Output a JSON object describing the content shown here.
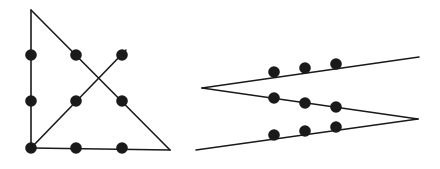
{
  "canvas": {
    "width": 440,
    "height": 169,
    "background": "#ffffff",
    "title": "Two geometric dot-and-line figures"
  },
  "style": {
    "line_color": "#1a1a1a",
    "line_width": 1.6,
    "dot_color": "#1a1a1a",
    "dot_radius": 5.8
  },
  "figures": [
    {
      "id": "left-figure",
      "name": "triangle-with-crossing-diagonals",
      "label": "Triangle with crossed diagonals and nine dots",
      "vertices": {
        "apex": {
          "x": 31,
          "y": 10
        },
        "bottom_left": {
          "x": 31,
          "y": 148
        },
        "bottom_right": {
          "x": 170,
          "y": 150
        }
      },
      "segments": [
        {
          "name": "left-vertical-edge",
          "x1": 31,
          "y1": 10,
          "x2": 31,
          "y2": 148
        },
        {
          "name": "hypotenuse-apex-to-bottom-right",
          "x1": 31,
          "y1": 10,
          "x2": 170,
          "y2": 150
        },
        {
          "name": "bottom-edge",
          "x1": 31,
          "y1": 148,
          "x2": 170,
          "y2": 150
        },
        {
          "name": "rising-diagonal-bottom-left-to-upper-right",
          "x1": 31,
          "y1": 148,
          "x2": 126,
          "y2": 50
        }
      ],
      "dots": [
        {
          "name": "dot-left-upper",
          "x": 31,
          "y": 55
        },
        {
          "name": "dot-left-middle",
          "x": 31,
          "y": 101
        },
        {
          "name": "dot-left-bottom-corner",
          "x": 31,
          "y": 148
        },
        {
          "name": "dot-top-middle",
          "x": 76,
          "y": 55
        },
        {
          "name": "dot-top-right",
          "x": 122,
          "y": 55
        },
        {
          "name": "dot-center-left",
          "x": 76,
          "y": 101
        },
        {
          "name": "dot-center-right",
          "x": 122,
          "y": 101
        },
        {
          "name": "dot-bottom-middle-left",
          "x": 76,
          "y": 148
        },
        {
          "name": "dot-bottom-middle-right",
          "x": 122,
          "y": 148
        }
      ]
    },
    {
      "id": "right-figure",
      "name": "zigzag-chevron-with-dot-grid",
      "label": "Open zigzag chevron with nine dots in three rows",
      "vertices": {
        "left_vertex": {
          "x": 202,
          "y": 88
        },
        "right_vertex": {
          "x": 418,
          "y": 119
        },
        "top_right_end": {
          "x": 419,
          "y": 57
        },
        "bottom_left_end": {
          "x": 196,
          "y": 150
        }
      },
      "segments": [
        {
          "name": "upper-arm-top-right-to-left-vertex",
          "x1": 419,
          "y1": 57,
          "x2": 202,
          "y2": 88
        },
        {
          "name": "middle-arm-left-vertex-to-right-vertex",
          "x1": 202,
          "y1": 88,
          "x2": 418,
          "y2": 119
        },
        {
          "name": "lower-arm-right-vertex-to-bottom-left-end",
          "x1": 418,
          "y1": 119,
          "x2": 196,
          "y2": 150
        }
      ],
      "dots": [
        {
          "name": "dot-upper-row-left",
          "x": 274,
          "y": 72
        },
        {
          "name": "dot-upper-row-middle",
          "x": 305,
          "y": 68
        },
        {
          "name": "dot-upper-row-right",
          "x": 336,
          "y": 64
        },
        {
          "name": "dot-middle-row-left",
          "x": 274,
          "y": 98
        },
        {
          "name": "dot-middle-row-middle",
          "x": 305,
          "y": 103
        },
        {
          "name": "dot-middle-row-right",
          "x": 336,
          "y": 107
        },
        {
          "name": "dot-lower-row-left",
          "x": 274,
          "y": 135
        },
        {
          "name": "dot-lower-row-middle",
          "x": 305,
          "y": 131
        },
        {
          "name": "dot-lower-row-right",
          "x": 336,
          "y": 127
        }
      ]
    }
  ]
}
